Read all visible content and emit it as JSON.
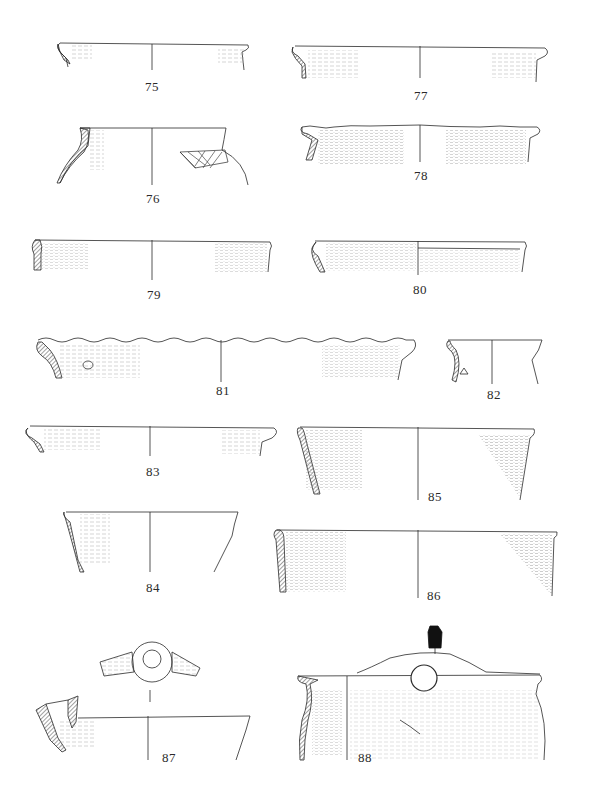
{
  "plate": {
    "type": "archaeological pottery drawing plate",
    "figures": [
      {
        "id": "75",
        "label": "75",
        "form": "everted rim jar"
      },
      {
        "id": "76",
        "label": "76",
        "form": "necked jar with incised lattice decoration"
      },
      {
        "id": "77",
        "label": "77",
        "form": "everted rim bowl"
      },
      {
        "id": "78",
        "label": "78",
        "form": "everted rim with wavy lip"
      },
      {
        "id": "79",
        "label": "79",
        "form": "vertical-sided rim"
      },
      {
        "id": "80",
        "label": "80",
        "form": "vertical-sided rim with groove"
      },
      {
        "id": "81",
        "label": "81",
        "form": "large everted rim with wavy lip"
      },
      {
        "id": "82",
        "label": "82",
        "form": "small necked rim"
      },
      {
        "id": "83",
        "label": "83",
        "form": "everted rim bowl"
      },
      {
        "id": "84",
        "label": "84",
        "form": "flared bowl"
      },
      {
        "id": "85",
        "label": "85",
        "form": "conical bowl"
      },
      {
        "id": "86",
        "label": "86",
        "form": "conical bowl wide"
      },
      {
        "id": "87",
        "label": "87",
        "form": "rim with lug handle (plan and section)"
      },
      {
        "id": "88",
        "label": "88",
        "form": "jar with pierced lug handle"
      }
    ]
  },
  "colors": {
    "ink": "#2a2a2a",
    "hatch": "#555555",
    "background": "#ffffff"
  }
}
